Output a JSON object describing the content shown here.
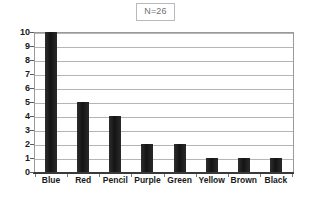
{
  "chart_data": {
    "type": "bar",
    "title": "N=26",
    "xlabel": "",
    "ylabel": "",
    "categories": [
      "Blue",
      "Red",
      "Pencil",
      "Purple",
      "Green",
      "Yellow",
      "Brown",
      "Black"
    ],
    "values": [
      10,
      5,
      4,
      2,
      2,
      1,
      1,
      1
    ],
    "ylim": [
      0,
      10
    ],
    "yticks": [
      0,
      1,
      2,
      3,
      4,
      5,
      6,
      7,
      8,
      9,
      10
    ],
    "ytick_labels": [
      "0",
      "1",
      "2",
      "3",
      "4",
      "5",
      "6",
      "7",
      "8",
      "9",
      "10"
    ],
    "grid": true,
    "grid_axis": "y",
    "legend": false,
    "legend_position": "none",
    "series": [
      {
        "name": "Count",
        "values": [
          10,
          5,
          4,
          2,
          2,
          1,
          1,
          1
        ]
      }
    ],
    "colors": {
      "bar": "#232323",
      "gridline": "#b5b5b5",
      "axis": "#3a3a3a",
      "plot_border": "#9a9a9a",
      "title_text": "#6f6f6f",
      "title_border": "#b9b9b9",
      "label_text": "#1a1a1a",
      "background": "#ffffff"
    }
  }
}
